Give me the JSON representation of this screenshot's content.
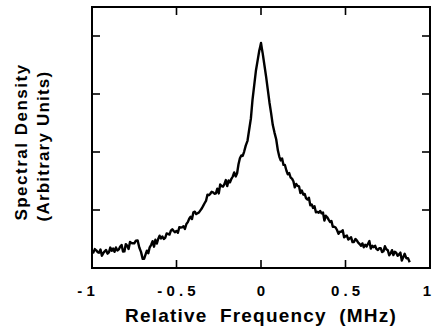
{
  "chart_data": {
    "type": "line",
    "title": "",
    "xlabel": "Relative Frequency (MHz)",
    "ylabel": [
      "Spectral Density",
      "(Arbitrary Units)"
    ],
    "xlim": [
      -1,
      1
    ],
    "ylim": [
      0,
      4.5
    ],
    "x_ticks": [
      -1,
      -0.5,
      0,
      0.5,
      1
    ],
    "x_tick_labels": [
      "- 1",
      "- 0 . 5",
      "0",
      "0 . 5",
      "1"
    ],
    "y_ticks": [
      1,
      2,
      3,
      4
    ],
    "y_tick_labels": [],
    "grid": false,
    "legend": null,
    "series": [
      {
        "name": "spectrum",
        "x": [
          -1.0,
          -0.95,
          -0.9,
          -0.85,
          -0.8,
          -0.75,
          -0.72,
          -0.7,
          -0.65,
          -0.6,
          -0.55,
          -0.5,
          -0.45,
          -0.4,
          -0.35,
          -0.3,
          -0.25,
          -0.2,
          -0.15,
          -0.1,
          -0.07,
          -0.05,
          -0.03,
          -0.01,
          0.0,
          0.01,
          0.03,
          0.05,
          0.07,
          0.1,
          0.15,
          0.2,
          0.25,
          0.3,
          0.35,
          0.4,
          0.45,
          0.5,
          0.55,
          0.6,
          0.65,
          0.7,
          0.75,
          0.8,
          0.85,
          0.88
        ],
        "values": [
          0.28,
          0.26,
          0.29,
          0.31,
          0.36,
          0.45,
          0.42,
          0.12,
          0.38,
          0.52,
          0.55,
          0.66,
          0.72,
          0.91,
          1.08,
          1.26,
          1.35,
          1.48,
          1.62,
          2.03,
          2.35,
          2.9,
          3.4,
          3.75,
          3.88,
          3.7,
          3.3,
          2.85,
          2.4,
          2.03,
          1.65,
          1.43,
          1.25,
          1.09,
          0.95,
          0.79,
          0.66,
          0.57,
          0.5,
          0.43,
          0.4,
          0.34,
          0.3,
          0.22,
          0.18,
          0.1
        ]
      }
    ]
  },
  "axes": {
    "xlabel": "Relative Frequency (MHz)",
    "ylabel_line1": "Spectral Density",
    "ylabel_line2": "(Arbitrary Units)",
    "xtick_labels": [
      "- 1",
      "- 0 . 5",
      "0",
      "0 . 5",
      "1"
    ]
  }
}
